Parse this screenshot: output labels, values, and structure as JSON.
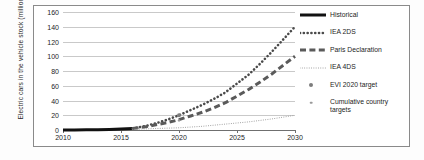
{
  "chart_data": {
    "type": "line",
    "title": "",
    "xlabel": "",
    "ylabel": "Electric cars in the vehicle stock (millions)",
    "xlim": [
      2010,
      2030
    ],
    "ylim": [
      0,
      160
    ],
    "grid": true,
    "legend_position": "right",
    "y_ticks": [
      0,
      20,
      40,
      60,
      80,
      100,
      120,
      140,
      160
    ],
    "x_ticks": [
      2010,
      2015,
      2020,
      2025,
      2030
    ],
    "series": [
      {
        "name": "Historical",
        "style": "solid-thick",
        "color": "#111111",
        "x": [
          2010,
          2011,
          2012,
          2013,
          2014,
          2015,
          2016
        ],
        "values": [
          0.0,
          0.05,
          0.2,
          0.4,
          0.7,
          1.3,
          2.0
        ]
      },
      {
        "name": "IEA 2DS",
        "style": "dotted",
        "color": "#4a4a4a",
        "x": [
          2016,
          2017,
          2018,
          2019,
          2020,
          2021,
          2022,
          2023,
          2024,
          2025,
          2026,
          2027,
          2028,
          2029,
          2030
        ],
        "values": [
          2,
          5,
          9,
          14,
          20,
          27,
          34,
          42,
          51,
          63,
          75,
          90,
          106,
          123,
          140
        ]
      },
      {
        "name": "Paris Declaration",
        "style": "dashed-thick",
        "color": "#5a5a5a",
        "x": [
          2016,
          2017,
          2018,
          2019,
          2020,
          2021,
          2022,
          2023,
          2024,
          2025,
          2026,
          2027,
          2028,
          2029,
          2030
        ],
        "values": [
          2,
          4,
          7,
          10,
          14,
          19,
          24,
          30,
          37,
          46,
          55,
          65,
          76,
          88,
          100
        ]
      },
      {
        "name": "IEA 4DS",
        "style": "fine-dotted",
        "color": "#9a9a9a",
        "x": [
          2016,
          2018,
          2020,
          2022,
          2024,
          2026,
          2028,
          2030
        ],
        "values": [
          1,
          2,
          3,
          5,
          8,
          11,
          15,
          20
        ]
      }
    ],
    "markers": [
      {
        "name": "EVI 2020 target",
        "x": 2020,
        "y": 20,
        "color": "#7d7d7d",
        "size": "large"
      },
      {
        "name": "Cumulative country targets",
        "x": 2020,
        "y": 13,
        "color": "#9a9a9a",
        "size": "small"
      }
    ]
  },
  "axes": {
    "y_title": "Electric cars in the vehicle stock (millions)",
    "y_ticks": [
      "160",
      "140",
      "120",
      "100",
      "80",
      "60",
      "40",
      "20",
      "0"
    ],
    "x_ticks": [
      "2010",
      "2015",
      "2020",
      "2025",
      "2030"
    ]
  },
  "legend": {
    "items": [
      {
        "label": "Historical",
        "key": "solid-thick-line-key"
      },
      {
        "label": "IEA 2DS",
        "key": "dotted-line-key"
      },
      {
        "label": "Paris Declaration",
        "key": "dashed-line-key"
      },
      {
        "label": "IEA 4DS",
        "key": "fine-dotted-line-key"
      },
      {
        "label": "EVI 2020 target",
        "key": "large-dot-key"
      },
      {
        "label": "Cumulative country targets",
        "key": "small-dot-key"
      }
    ]
  }
}
